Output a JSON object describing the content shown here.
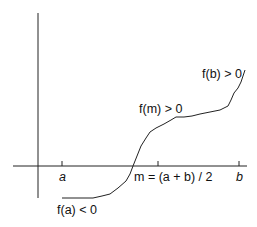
{
  "diagram": {
    "labels": {
      "a": "a",
      "m_eq": "m = (a + b) / 2",
      "b": "b",
      "f_a": "f(a) < 0",
      "f_m": "f(m) > 0",
      "f_b": "f(b) > 0"
    },
    "colors": {
      "line": "#222222",
      "background": "#ffffff"
    }
  }
}
